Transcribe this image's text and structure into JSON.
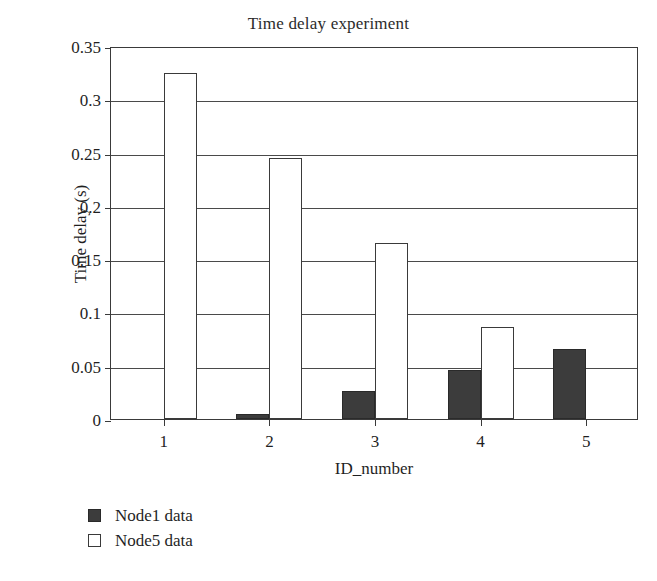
{
  "chart_data": {
    "type": "bar",
    "title": "Time delay experiment",
    "xlabel": "ID_number",
    "ylabel": "Time delay (s)",
    "categories": [
      "1",
      "2",
      "3",
      "4",
      "5"
    ],
    "series": [
      {
        "name": "Node1 data",
        "values": [
          0,
          0.005,
          0.026,
          0.046,
          0.066
        ],
        "color": "#3c3c3c",
        "fill": "solid"
      },
      {
        "name": "Node5 data",
        "values": [
          0.325,
          0.245,
          0.165,
          0.086,
          0
        ],
        "color": "#ffffff",
        "fill": "hollow"
      }
    ],
    "ylim": [
      0,
      0.35
    ],
    "yticks": [
      0,
      0.05,
      0.1,
      0.15,
      0.2,
      0.25,
      0.3,
      0.35
    ],
    "ytick_labels": [
      "0",
      "0.05",
      "0.1",
      "0.15",
      "0.2",
      "0.25",
      "0.3",
      "0.35"
    ],
    "grid": true,
    "grid_axis": "y",
    "legend_position": "below-left",
    "legend_entries": [
      "Node1 data",
      "Node5 data"
    ]
  },
  "colors": {
    "axis": "#3a3a3a",
    "grid": "#4a4a4a",
    "node1": "#3c3c3c",
    "node5": "#ffffff",
    "text": "#1f1f1f",
    "background": "#ffffff"
  }
}
